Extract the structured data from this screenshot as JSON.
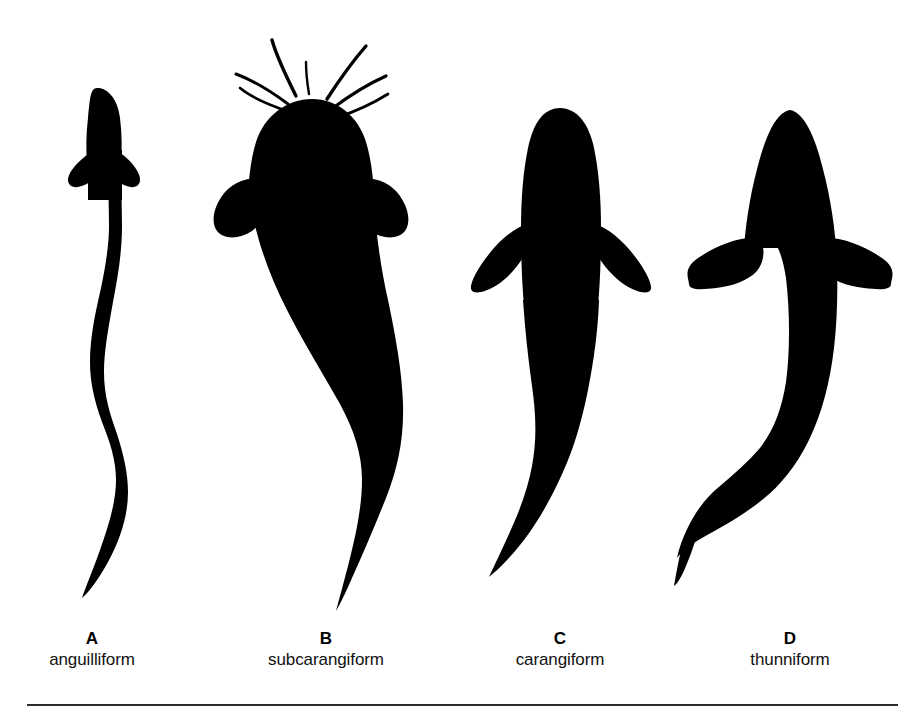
{
  "figure": {
    "background_color": "#ffffff",
    "silhouette_color": "#000000",
    "rule_color": "#2b2b30"
  },
  "specimens": [
    {
      "letter": "A",
      "name": "anguilliform",
      "icon": "eel-silhouette-icon",
      "body_form": "elongate serpentine body with small rounded pectoral fins and a long sinuous tapering tail"
    },
    {
      "letter": "B",
      "name": "subcarangiform",
      "icon": "catfish-silhouette-icon",
      "body_form": "broad rounded head with barbels, wide rounded pectoral fins and a long sweeping tail"
    },
    {
      "letter": "C",
      "name": "carangiform",
      "icon": "carangiform-fish-silhouette-icon",
      "body_form": "streamlined fusiform body with swept-back pointed pectoral fins and a curved tapering tail"
    },
    {
      "letter": "D",
      "name": "thunniform",
      "icon": "tuna-silhouette-icon",
      "body_form": "deep robust body with long horizontal wing-like pectoral fins and a sharply hooked narrow caudal peduncle"
    }
  ]
}
